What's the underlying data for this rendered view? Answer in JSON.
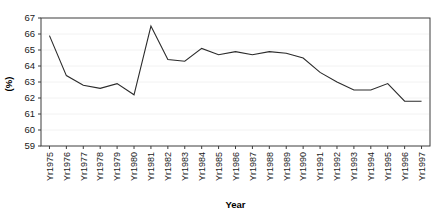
{
  "chart_data": {
    "type": "line",
    "title": "",
    "subtitle": "",
    "xlabel": "Year",
    "ylabel": "(%)",
    "ylim": [
      59,
      67
    ],
    "ytick_step": 1,
    "grid": true,
    "legend": null,
    "legend_position": "none",
    "annotations": [],
    "line_color": "#2b2b2b",
    "categories": [
      "Yr1975",
      "Yr1976",
      "Yr1977",
      "Yr1978",
      "Yr1979",
      "Yr1980",
      "Yr1981",
      "Yr1982",
      "Yr1983",
      "Yr1984",
      "Yr1985",
      "Yr1986",
      "Yr1987",
      "Yr1988",
      "Yr1989",
      "Yr1990",
      "Yr1991",
      "Yr1992",
      "Yr1993",
      "Yr1994",
      "Yr1995",
      "Yr1996",
      "Yr1997"
    ],
    "ytick_labels": [
      "59",
      "60",
      "61",
      "62",
      "63",
      "64",
      "65",
      "66",
      "67"
    ],
    "values": [
      65.9,
      63.4,
      62.8,
      62.6,
      62.9,
      62.2,
      66.5,
      64.4,
      64.3,
      65.1,
      64.7,
      64.9,
      64.7,
      64.9,
      64.8,
      64.5,
      63.6,
      63.0,
      62.5,
      62.5,
      62.9,
      61.8,
      61.8
    ],
    "series": [
      {
        "name": "",
        "values": [
          65.9,
          63.4,
          62.8,
          62.6,
          62.9,
          62.2,
          66.5,
          64.4,
          64.3,
          65.1,
          64.7,
          64.9,
          64.7,
          64.9,
          64.8,
          64.5,
          63.6,
          63.0,
          62.5,
          62.5,
          62.9,
          61.8,
          61.8
        ]
      }
    ]
  },
  "axis": {
    "x_title": "Year",
    "y_title": "(%)"
  }
}
